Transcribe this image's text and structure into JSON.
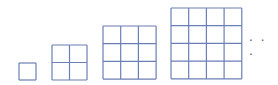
{
  "diagram": {
    "grids": [
      {
        "n": 1,
        "x": 19,
        "y": 63,
        "cell": 17
      },
      {
        "n": 2,
        "x": 52,
        "y": 45,
        "cell": 17.5
      },
      {
        "n": 3,
        "x": 103,
        "y": 26,
        "cell": 17.7
      },
      {
        "n": 4,
        "x": 171,
        "y": 8,
        "cell": 17.7
      }
    ],
    "continuation": "· · ·",
    "line_color": "#6a7fb5"
  }
}
